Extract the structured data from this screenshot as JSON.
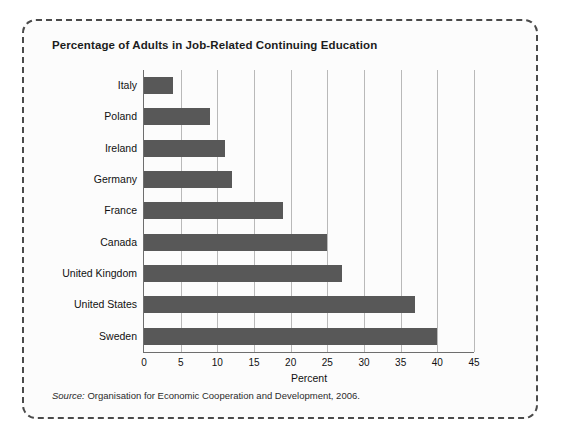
{
  "figure": {
    "title": "Percentage of Adults in Job-Related Continuing Education",
    "source_label": "Source:",
    "source_text": " Organisation for Economic Cooperation and Development, 2006."
  },
  "style": {
    "bar_color": "#585858",
    "grid_color": "#b9b9b9",
    "axis_color": "#6e6e6e",
    "border_color": "#4a4a4a",
    "panel_background": "#fcfcfc"
  },
  "chart_data": {
    "type": "bar",
    "orientation": "horizontal",
    "title": "Percentage of Adults in Job-Related Continuing Education",
    "xlabel": "Percent",
    "ylabel": "",
    "xlim": [
      0,
      45
    ],
    "xticks": [
      0,
      5,
      10,
      15,
      20,
      25,
      30,
      35,
      40,
      45
    ],
    "xtick_labels": [
      "0",
      "5",
      "10",
      "15",
      "20",
      "25",
      "30",
      "35",
      "40",
      "45"
    ],
    "grid": "vertical",
    "legend": "none",
    "categories": [
      "Italy",
      "Poland",
      "Ireland",
      "Germany",
      "France",
      "Canada",
      "United Kingdom",
      "United States",
      "Sweden"
    ],
    "values": [
      4,
      9,
      11,
      12,
      19,
      25,
      27,
      37,
      40
    ]
  }
}
